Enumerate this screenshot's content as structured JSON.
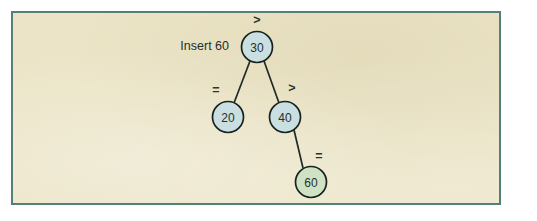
{
  "figure": {
    "caption": "Insert 60",
    "panel": {
      "background_color": "#ebe4c6",
      "border_color": "#54807a"
    }
  },
  "chart_data": {
    "type": "diagram",
    "title": "Insert 60",
    "diagram_kind": "binary-search-tree-insertion",
    "nodes": [
      {
        "id": "n30",
        "label": "30",
        "cx": 257,
        "cy": 47,
        "r": 15.5,
        "fill": "#cadfe2",
        "role": "root"
      },
      {
        "id": "n20",
        "label": "20",
        "cx": 228,
        "cy": 117,
        "r": 15.5,
        "fill": "#cadfe2",
        "role": "left-child"
      },
      {
        "id": "n40",
        "label": "40",
        "cx": 285,
        "cy": 117,
        "r": 15.5,
        "fill": "#cadfe2",
        "role": "right-child"
      },
      {
        "id": "n60",
        "label": "60",
        "cx": 311,
        "cy": 182,
        "r": 15.5,
        "fill": "#cfe3c4",
        "role": "inserted-node"
      }
    ],
    "edges": [
      {
        "id": "e30-20",
        "from": "n30",
        "to": "n20",
        "x1": 250,
        "y1": 61,
        "x2": 234,
        "y2": 103
      },
      {
        "id": "e30-40",
        "from": "n30",
        "to": "n40",
        "x1": 264,
        "y1": 61,
        "x2": 279,
        "y2": 103
      },
      {
        "id": "e40-60",
        "from": "n40",
        "to": "n60",
        "x1": 294,
        "y1": 130,
        "x2": 303,
        "y2": 168
      }
    ],
    "annotations": [
      {
        "id": "a-root",
        "label": ">",
        "x": 257,
        "y": 20,
        "attached_to": "n30"
      },
      {
        "id": "a-left",
        "label": "=",
        "x": 216,
        "y": 90,
        "attached_to": "e30-20"
      },
      {
        "id": "a-right",
        "label": ">",
        "x": 292,
        "y": 88,
        "attached_to": "e30-40"
      },
      {
        "id": "a-leaf",
        "label": "=",
        "x": 319,
        "y": 156,
        "attached_to": "e40-60"
      }
    ],
    "caption": {
      "text": "Insert 60",
      "x": 229,
      "y": 46
    }
  }
}
